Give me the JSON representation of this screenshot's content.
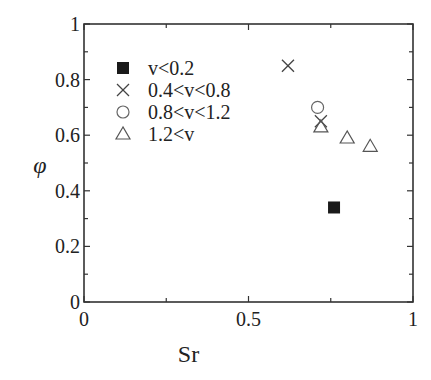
{
  "chart_data": {
    "type": "scatter",
    "title": "",
    "xlabel": "Sr",
    "ylabel": "φ",
    "xlim": [
      0,
      1
    ],
    "ylim": [
      0,
      1
    ],
    "xticks": [
      "0",
      "0.5",
      "1"
    ],
    "yticks": [
      "0",
      "0.2",
      "0.4",
      "0.6",
      "0.8",
      "1"
    ],
    "grid": false,
    "legend_position": "upper left",
    "series": [
      {
        "name": "v<0.2",
        "marker": "filled-square",
        "points": [
          [
            0.76,
            0.34
          ]
        ]
      },
      {
        "name": "0.4<v<0.8",
        "marker": "cross",
        "points": [
          [
            0.62,
            0.85
          ],
          [
            0.72,
            0.65
          ]
        ]
      },
      {
        "name": "0.8<v<1.2",
        "marker": "open-circle",
        "points": [
          [
            0.71,
            0.7
          ]
        ]
      },
      {
        "name": "1.2<v",
        "marker": "open-triangle",
        "points": [
          [
            0.72,
            0.63
          ],
          [
            0.8,
            0.59
          ],
          [
            0.87,
            0.56
          ]
        ]
      }
    ]
  }
}
